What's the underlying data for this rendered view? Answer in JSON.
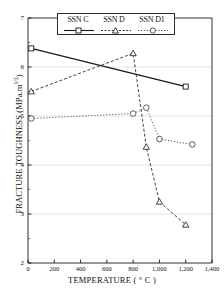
{
  "chart_data": {
    "type": "line",
    "title": "",
    "xlabel": "TEMPERATURE ( ° C )",
    "ylabel": "FRACTURE TOUGHNESS (MPa.m",
    "ylabel_exponent": "1/2",
    "ylabel_suffix": ")",
    "xlim": [
      0,
      1400
    ],
    "ylim": [
      2,
      7
    ],
    "xticks": [
      0,
      200,
      400,
      600,
      800,
      1000,
      1200,
      1400
    ],
    "xtick_labels": [
      "0",
      "200",
      "400",
      "600",
      "800",
      "1,000",
      "1,200",
      "1,400"
    ],
    "yticks": [
      2,
      3,
      4,
      5,
      6,
      7
    ],
    "ytick_labels": [
      "2",
      "3",
      "4",
      "5",
      "6",
      "7"
    ],
    "grid": "horizontal",
    "legend_position": "top-center",
    "series": [
      {
        "name": "SSN C",
        "marker": "square",
        "linestyle": "solid",
        "color": "#1a1a1a",
        "x": [
          25,
          1200
        ],
        "y": [
          6.38,
          5.6
        ]
      },
      {
        "name": "SSN D",
        "marker": "triangle",
        "linestyle": "dashed",
        "color": "#2e2e2e",
        "x": [
          25,
          800,
          900,
          1000,
          1200
        ],
        "y": [
          5.5,
          6.28,
          4.37,
          3.25,
          2.78
        ]
      },
      {
        "name": "SSN D1",
        "marker": "circle",
        "linestyle": "dotted",
        "color": "#4a4a4a",
        "x": [
          25,
          800,
          900,
          1000,
          1250
        ],
        "y": [
          4.95,
          5.05,
          5.17,
          4.53,
          4.42
        ]
      }
    ]
  },
  "legend": {
    "items": [
      {
        "label": "SSN C"
      },
      {
        "label": "SSN D"
      },
      {
        "label": "SSN D1"
      }
    ]
  }
}
